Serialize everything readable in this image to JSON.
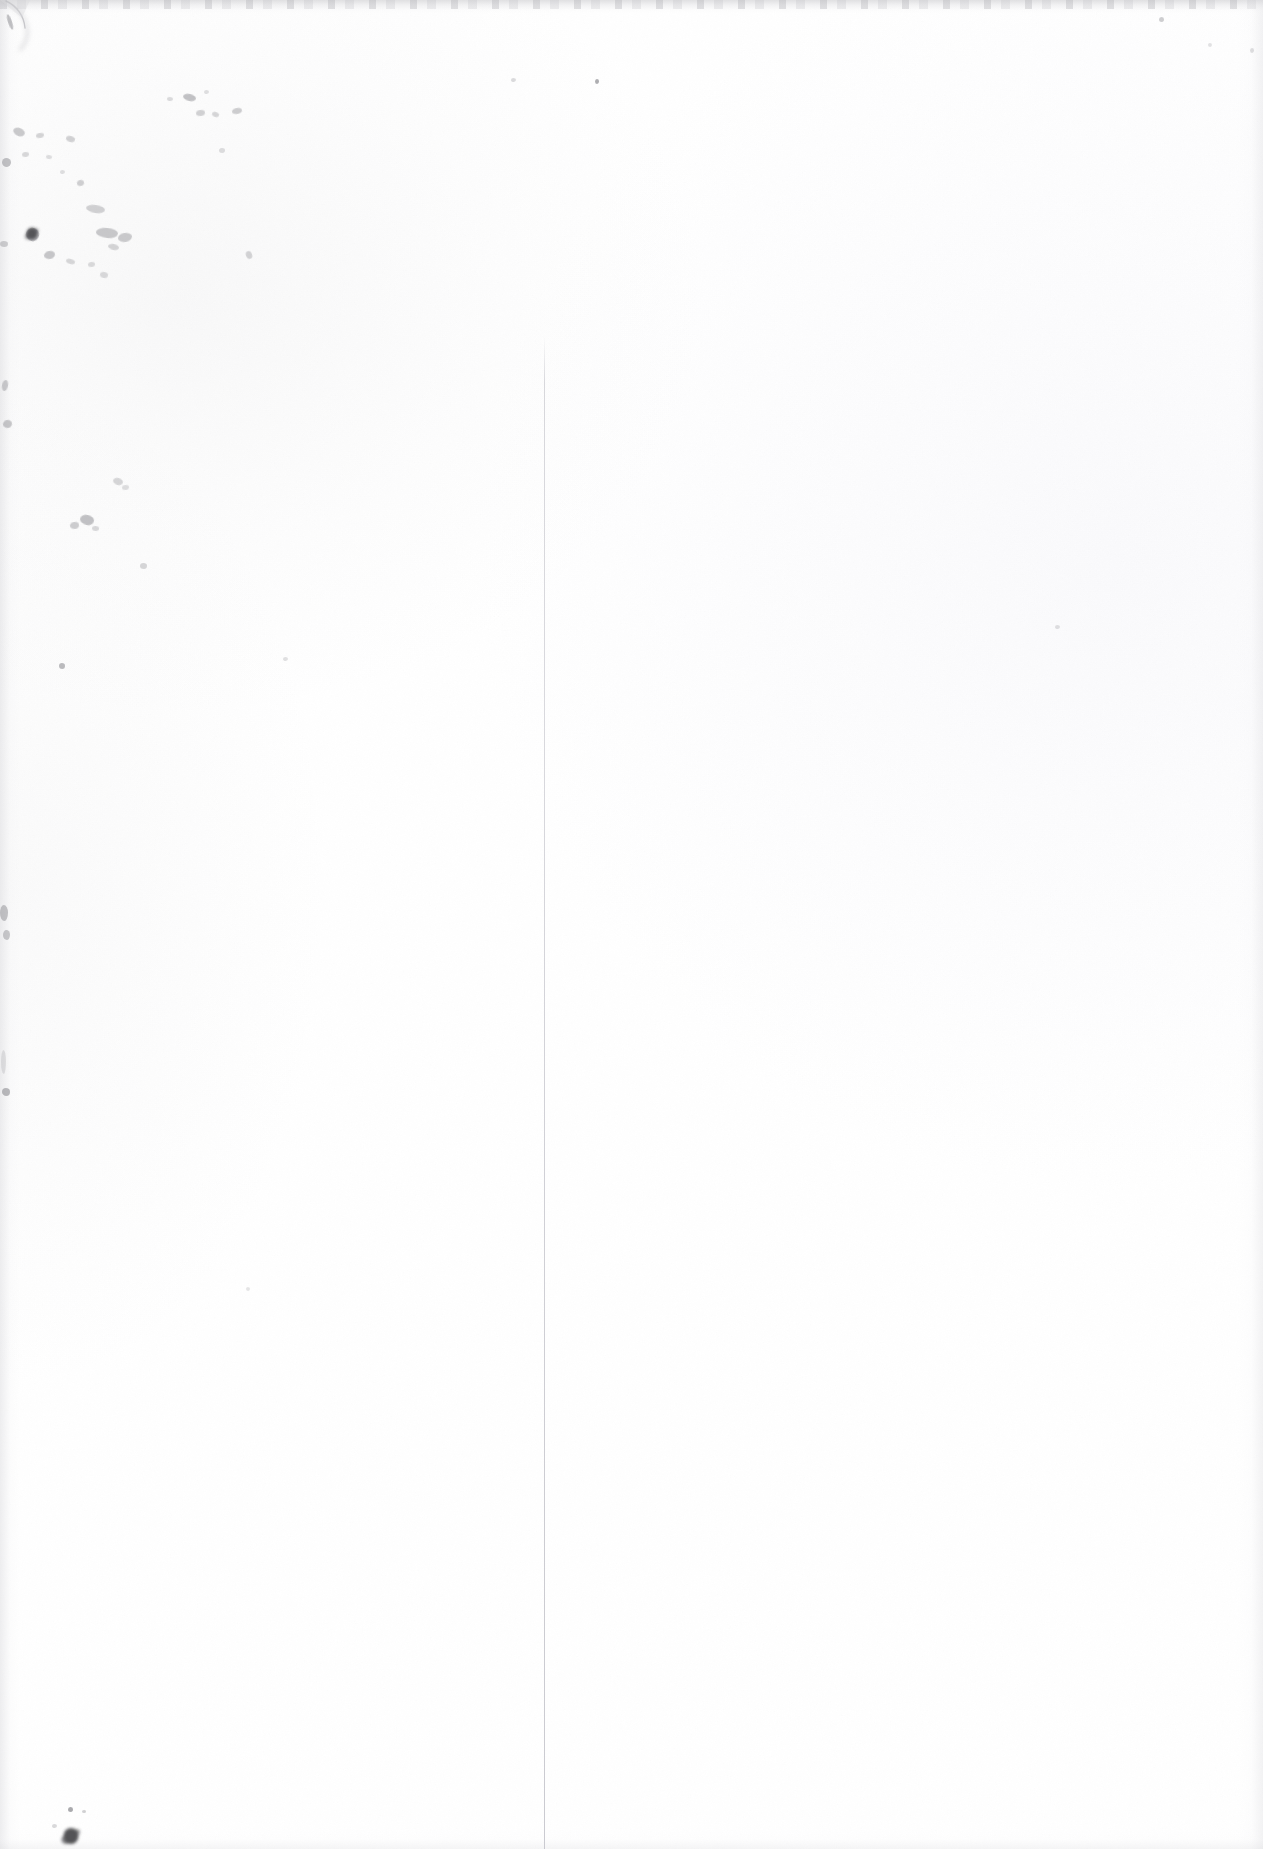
{
  "page": {
    "kind": "scanned-document-page",
    "width": 1263,
    "height": 1849,
    "visible_text": "",
    "background_color": "#fefefe",
    "paper_tint": "#fcfcfc"
  },
  "artifacts": {
    "gutter_line": {
      "name": "vertical-gutter-line",
      "color": "#d2d2d7",
      "x": 544,
      "y_start": 337,
      "y_end": 1849,
      "thickness": 1
    },
    "scan_edges": {
      "top_band_color": "#c9c9cd",
      "top_band_height": 14,
      "side_shadow_color": "#d6d6da"
    },
    "corner_curl": {
      "name": "top-left-corner-curl",
      "color": "#b8b8bd"
    },
    "speckle_color": "#8d8d92",
    "ink_blob_color": "#2e2e32"
  },
  "speckles": [
    {
      "x": 8,
      "y": 14,
      "w": 4,
      "h": 16,
      "o": 0.55,
      "r": -18
    },
    {
      "x": 183,
      "y": 94,
      "w": 13,
      "h": 7,
      "o": 0.52,
      "r": 12
    },
    {
      "x": 196,
      "y": 110,
      "w": 9,
      "h": 6,
      "o": 0.38,
      "r": -8
    },
    {
      "x": 212,
      "y": 112,
      "w": 7,
      "h": 5,
      "o": 0.34,
      "r": 20
    },
    {
      "x": 232,
      "y": 108,
      "w": 10,
      "h": 6,
      "o": 0.42,
      "r": -14
    },
    {
      "x": 167,
      "y": 97,
      "w": 6,
      "h": 4,
      "o": 0.3,
      "r": 6
    },
    {
      "x": 204,
      "y": 90,
      "w": 5,
      "h": 4,
      "o": 0.26,
      "r": 0
    },
    {
      "x": 595,
      "y": 79,
      "w": 4,
      "h": 5,
      "o": 0.7,
      "r": 0
    },
    {
      "x": 13,
      "y": 128,
      "w": 12,
      "h": 8,
      "o": 0.45,
      "r": 22
    },
    {
      "x": 36,
      "y": 133,
      "w": 8,
      "h": 5,
      "o": 0.36,
      "r": -10
    },
    {
      "x": 66,
      "y": 136,
      "w": 9,
      "h": 6,
      "o": 0.38,
      "r": 14
    },
    {
      "x": 22,
      "y": 152,
      "w": 7,
      "h": 5,
      "o": 0.32,
      "r": -6
    },
    {
      "x": 46,
      "y": 155,
      "w": 6,
      "h": 4,
      "o": 0.28,
      "r": 10
    },
    {
      "x": 2,
      "y": 158,
      "w": 9,
      "h": 9,
      "o": 0.52,
      "r": 0
    },
    {
      "x": 77,
      "y": 180,
      "w": 7,
      "h": 6,
      "o": 0.4,
      "r": -16
    },
    {
      "x": 86,
      "y": 205,
      "w": 19,
      "h": 8,
      "o": 0.38,
      "r": 8
    },
    {
      "x": 60,
      "y": 170,
      "w": 5,
      "h": 4,
      "o": 0.26,
      "r": 0
    },
    {
      "x": 96,
      "y": 228,
      "w": 22,
      "h": 10,
      "o": 0.46,
      "r": 5
    },
    {
      "x": 118,
      "y": 233,
      "w": 14,
      "h": 9,
      "o": 0.44,
      "r": -9
    },
    {
      "x": 108,
      "y": 244,
      "w": 11,
      "h": 6,
      "o": 0.35,
      "r": 12
    },
    {
      "x": 26,
      "y": 228,
      "w": 13,
      "h": 13,
      "o": 0.66,
      "r": 18
    },
    {
      "x": 44,
      "y": 251,
      "w": 11,
      "h": 8,
      "o": 0.48,
      "r": -12
    },
    {
      "x": 0,
      "y": 241,
      "w": 8,
      "h": 6,
      "o": 0.4,
      "r": 0
    },
    {
      "x": 66,
      "y": 259,
      "w": 9,
      "h": 5,
      "o": 0.33,
      "r": 16
    },
    {
      "x": 88,
      "y": 262,
      "w": 7,
      "h": 5,
      "o": 0.3,
      "r": -7
    },
    {
      "x": 100,
      "y": 272,
      "w": 8,
      "h": 6,
      "o": 0.31,
      "r": 9
    },
    {
      "x": 246,
      "y": 251,
      "w": 6,
      "h": 8,
      "o": 0.36,
      "r": -22
    },
    {
      "x": 219,
      "y": 148,
      "w": 6,
      "h": 5,
      "o": 0.28,
      "r": 0
    },
    {
      "x": 511,
      "y": 78,
      "w": 5,
      "h": 4,
      "o": 0.3,
      "r": 0
    },
    {
      "x": 1159,
      "y": 17,
      "w": 5,
      "h": 5,
      "o": 0.42,
      "r": 0
    },
    {
      "x": 1250,
      "y": 48,
      "w": 4,
      "h": 5,
      "o": 0.28,
      "r": 0
    },
    {
      "x": 1208,
      "y": 43,
      "w": 4,
      "h": 4,
      "o": 0.24,
      "r": 0
    },
    {
      "x": 2,
      "y": 380,
      "w": 6,
      "h": 11,
      "o": 0.44,
      "r": 10
    },
    {
      "x": 3,
      "y": 420,
      "w": 9,
      "h": 8,
      "o": 0.48,
      "r": -14
    },
    {
      "x": 113,
      "y": 478,
      "w": 10,
      "h": 7,
      "o": 0.34,
      "r": 16
    },
    {
      "x": 122,
      "y": 485,
      "w": 7,
      "h": 5,
      "o": 0.28,
      "r": -8
    },
    {
      "x": 80,
      "y": 515,
      "w": 14,
      "h": 10,
      "o": 0.52,
      "r": 12
    },
    {
      "x": 70,
      "y": 522,
      "w": 9,
      "h": 7,
      "o": 0.42,
      "r": -10
    },
    {
      "x": 92,
      "y": 526,
      "w": 7,
      "h": 5,
      "o": 0.32,
      "r": 5
    },
    {
      "x": 140,
      "y": 563,
      "w": 7,
      "h": 6,
      "o": 0.34,
      "r": 0
    },
    {
      "x": 59,
      "y": 663,
      "w": 6,
      "h": 6,
      "o": 0.58,
      "r": 0
    },
    {
      "x": 283,
      "y": 657,
      "w": 5,
      "h": 4,
      "o": 0.26,
      "r": 0
    },
    {
      "x": 1055,
      "y": 625,
      "w": 5,
      "h": 4,
      "o": 0.26,
      "r": 0
    },
    {
      "x": 0,
      "y": 905,
      "w": 8,
      "h": 16,
      "o": 0.5,
      "r": 0
    },
    {
      "x": 3,
      "y": 930,
      "w": 7,
      "h": 10,
      "o": 0.46,
      "r": 0
    },
    {
      "x": 2,
      "y": 1088,
      "w": 8,
      "h": 8,
      "o": 0.6,
      "r": 0
    },
    {
      "x": 1,
      "y": 1050,
      "w": 5,
      "h": 24,
      "o": 0.22,
      "r": 0
    },
    {
      "x": 246,
      "y": 1287,
      "w": 4,
      "h": 4,
      "o": 0.22,
      "r": 0
    },
    {
      "x": 68,
      "y": 1807,
      "w": 5,
      "h": 5,
      "o": 0.74,
      "r": 0
    },
    {
      "x": 82,
      "y": 1810,
      "w": 4,
      "h": 3,
      "o": 0.4,
      "r": 0
    },
    {
      "x": 52,
      "y": 1824,
      "w": 5,
      "h": 4,
      "o": 0.32,
      "r": 0
    }
  ],
  "blobs": [
    {
      "name": "bottom-left-ink-mark",
      "x": 60,
      "y": 1826,
      "w": 22,
      "h": 20,
      "o": 0.82
    },
    {
      "name": "upper-left-ink-cluster",
      "x": 24,
      "y": 226,
      "w": 16,
      "h": 15,
      "o": 0.7
    }
  ]
}
